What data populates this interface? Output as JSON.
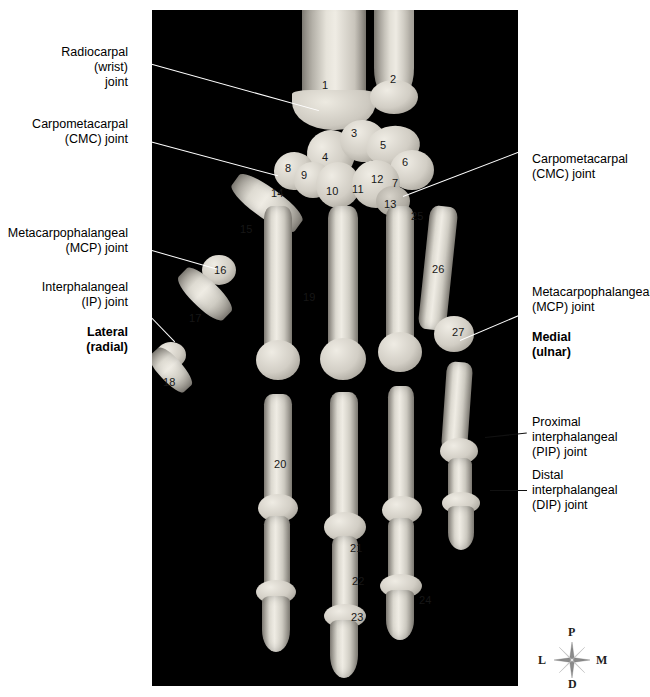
{
  "figure": {
    "alt": "Radiograph-style photograph of skeletal hand with numbered bones and joint labels"
  },
  "left_labels": [
    {
      "id": "radiocarpal",
      "lines": [
        "Radiocarpal",
        "(wrist)",
        "joint"
      ]
    },
    {
      "id": "cmc-left",
      "lines": [
        "Carpometacarpal",
        "(CMC) joint"
      ]
    },
    {
      "id": "mcp-left",
      "lines": [
        "Metacarpophalangeal",
        "(MCP) joint"
      ]
    },
    {
      "id": "ip-left",
      "lines": [
        "Interphalangeal",
        "(IP) joint"
      ]
    }
  ],
  "left_orientation": {
    "lines": [
      "Lateral",
      "(radial)"
    ]
  },
  "right_labels": [
    {
      "id": "cmc-right",
      "lines": [
        "Carpometacarpal",
        "(CMC) joint"
      ]
    },
    {
      "id": "mcp-right",
      "lines": [
        "Metacarpophalangeal",
        "(MCP) joint"
      ]
    },
    {
      "id": "pip-right",
      "lines": [
        "Proximal",
        "interphalangeal",
        "(PIP) joint"
      ]
    },
    {
      "id": "dip-right",
      "lines": [
        "Distal",
        "interphalangeal",
        "(DIP) joint"
      ]
    }
  ],
  "right_orientation": {
    "lines": [
      "Medial",
      "(ulnar)"
    ]
  },
  "bone_numbers": [
    {
      "n": "1",
      "x": 322,
      "y": 80
    },
    {
      "n": "2",
      "x": 390,
      "y": 74
    },
    {
      "n": "3",
      "x": 351,
      "y": 128
    },
    {
      "n": "4",
      "x": 322,
      "y": 152
    },
    {
      "n": "5",
      "x": 380,
      "y": 140
    },
    {
      "n": "6",
      "x": 402,
      "y": 157
    },
    {
      "n": "7",
      "x": 392,
      "y": 178
    },
    {
      "n": "8",
      "x": 285,
      "y": 163
    },
    {
      "n": "9",
      "x": 301,
      "y": 170
    },
    {
      "n": "10",
      "x": 326,
      "y": 186
    },
    {
      "n": "11",
      "x": 352,
      "y": 184
    },
    {
      "n": "12",
      "x": 371,
      "y": 174
    },
    {
      "n": "13",
      "x": 384,
      "y": 199
    },
    {
      "n": "14",
      "x": 271,
      "y": 188
    },
    {
      "n": "15",
      "x": 240,
      "y": 224
    },
    {
      "n": "16",
      "x": 214,
      "y": 265
    },
    {
      "n": "17",
      "x": 189,
      "y": 313
    },
    {
      "n": "18",
      "x": 163,
      "y": 377
    },
    {
      "n": "19",
      "x": 303,
      "y": 292
    },
    {
      "n": "20",
      "x": 274,
      "y": 459
    },
    {
      "n": "21",
      "x": 350,
      "y": 543
    },
    {
      "n": "22",
      "x": 352,
      "y": 576
    },
    {
      "n": "23",
      "x": 351,
      "y": 612
    },
    {
      "n": "24",
      "x": 419,
      "y": 595
    },
    {
      "n": "25",
      "x": 411,
      "y": 211
    },
    {
      "n": "26",
      "x": 432,
      "y": 264
    },
    {
      "n": "27",
      "x": 452,
      "y": 327
    }
  ],
  "compass": {
    "proximal": "P",
    "distal": "D",
    "lateral": "L",
    "medial": "M"
  },
  "colors": {
    "background": "#ffffff",
    "photo_background": "#000000",
    "bone": "#cfcbc2",
    "leader_line": "#ffffff",
    "text": "#000000"
  }
}
